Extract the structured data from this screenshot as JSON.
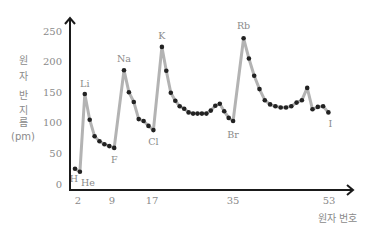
{
  "chart_data": {
    "type": "line",
    "title": "",
    "xlabel": "원자 번호",
    "ylabel": "원자 반지름 (pm)",
    "ylabel_lines": [
      "원",
      "자",
      "반",
      "지",
      "름",
      "(pm)"
    ],
    "ylim": [
      0,
      250
    ],
    "yticks": [
      0,
      50,
      100,
      150,
      200,
      250
    ],
    "xticks": [
      2,
      9,
      17,
      35,
      53
    ],
    "grid": false,
    "legend": null,
    "line_color": "#b3b3b3",
    "marker_color": "#222222",
    "series": [
      {
        "name": "원자 반지름",
        "x": [
          1,
          2,
          3,
          4,
          5,
          6,
          7,
          8,
          9,
          11,
          12,
          13,
          14,
          15,
          16,
          17,
          19,
          20,
          21,
          22,
          23,
          24,
          25,
          26,
          27,
          28,
          29,
          30,
          31,
          32,
          33,
          34,
          35,
          37,
          38,
          39,
          40,
          41,
          42,
          43,
          44,
          45,
          46,
          47,
          48,
          49,
          50,
          51,
          52,
          53
        ],
        "values": [
          25,
          20,
          147,
          105,
          78,
          70,
          65,
          62,
          59,
          186,
          150,
          134,
          106,
          103,
          95,
          88,
          224,
          185,
          149,
          136,
          127,
          123,
          117,
          115,
          115,
          115,
          115,
          120,
          128,
          131,
          119,
          108,
          103,
          238,
          205,
          177,
          155,
          137,
          130,
          127,
          125,
          125,
          127,
          133,
          137,
          157,
          122,
          126,
          127,
          117
        ]
      }
    ],
    "annotations": [
      {
        "text": "H",
        "x": 1,
        "y": 25
      },
      {
        "text": "He",
        "x": 2,
        "y": 20
      },
      {
        "text": "Li",
        "x": 3,
        "y": 147
      },
      {
        "text": "F",
        "x": 9,
        "y": 59
      },
      {
        "text": "Na",
        "x": 11,
        "y": 186
      },
      {
        "text": "Cl",
        "x": 17,
        "y": 88
      },
      {
        "text": "K",
        "x": 19,
        "y": 224
      },
      {
        "text": "Br",
        "x": 35,
        "y": 103
      },
      {
        "text": "Rb",
        "x": 37,
        "y": 238
      },
      {
        "text": "I",
        "x": 53,
        "y": 117
      }
    ]
  }
}
